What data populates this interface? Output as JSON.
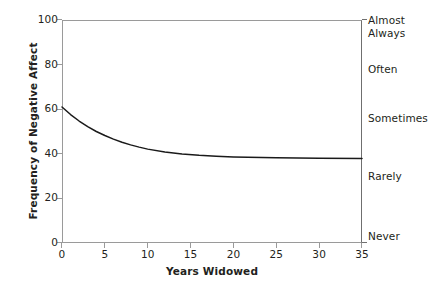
{
  "chart_data": {
    "type": "line",
    "title": "",
    "xlabel": "Years Widowed",
    "ylabel": "Frequency of Negative Affect",
    "xlim": [
      0,
      35
    ],
    "ylim": [
      0,
      100
    ],
    "grid": false,
    "legend": "none",
    "x_ticks": [
      "0",
      "5",
      "10",
      "15",
      "20",
      "25",
      "30",
      "35"
    ],
    "x_tick_values": [
      0,
      5,
      10,
      15,
      20,
      25,
      30,
      35
    ],
    "y_ticks": [
      "0",
      "20",
      "40",
      "60",
      "80",
      "100"
    ],
    "y_tick_values": [
      0,
      20,
      40,
      60,
      80,
      100
    ],
    "secondary_axis": {
      "position": "right",
      "label": "",
      "anchors": [
        {
          "text": "Almost\nAlways",
          "value": 100
        },
        {
          "text": "Often",
          "value": 78
        },
        {
          "text": "Sometimes",
          "value": 56
        },
        {
          "text": "Rarely",
          "value": 30
        },
        {
          "text": "Never",
          "value": 3
        }
      ]
    },
    "series": [
      {
        "name": "Frequency of Negative Affect",
        "color": "#1a1a1a",
        "x": [
          0,
          1,
          2,
          3,
          4,
          5,
          6,
          7,
          8,
          9,
          10,
          12,
          14,
          16,
          18,
          20,
          25,
          30,
          35
        ],
        "values": [
          61.0,
          57.6,
          54.7,
          52.2,
          50.0,
          48.2,
          46.6,
          45.2,
          44.0,
          43.0,
          42.1,
          40.8,
          39.9,
          39.3,
          38.9,
          38.6,
          38.2,
          38.0,
          37.9
        ]
      }
    ],
    "annotations": []
  },
  "axes": {
    "x_title": "Years Widowed",
    "y_title": "Frequency of Negative Affect"
  },
  "colors": {
    "curve": "#1a1a1a",
    "frame": "#9a9a9a",
    "frame_right": "#6f6f6f",
    "text": "#231f20",
    "background": "#ffffff"
  }
}
